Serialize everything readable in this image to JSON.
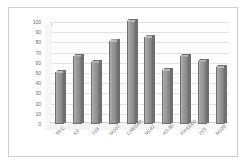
{
  "chart_data": {
    "type": "bar",
    "title": "",
    "subtitle": "",
    "xlabel": "",
    "ylabel": "",
    "categories": [
      "99-C",
      "K9",
      "2S9",
      "M107",
      "CAESAR",
      "M142",
      "AS-90",
      "PzH2000",
      "2S5",
      "M109"
    ],
    "values": [
      51,
      67,
      61,
      81,
      101,
      85,
      53,
      67,
      62,
      56
    ],
    "series": [
      {
        "name": "",
        "values": [
          51,
          67,
          61,
          81,
          101,
          85,
          53,
          67,
          62,
          56
        ]
      }
    ],
    "ylim": [
      0,
      100
    ],
    "ytick_labels": [
      "0",
      "10",
      "20",
      "30",
      "40",
      "50",
      "60",
      "70",
      "80",
      "90",
      "100"
    ],
    "ytick_values": [
      0,
      10,
      20,
      30,
      40,
      50,
      60,
      70,
      80,
      90,
      100
    ],
    "grid": true,
    "legend": false,
    "legend_position": "none",
    "style": "3d-column",
    "annotations": [],
    "colors": {
      "bar_face": "#9d9d9d",
      "bar_edge": "#6f6f6f",
      "bar_top": "#b9b9b9",
      "bar_side": "#6f6f6f",
      "gridline": "#e2e2e2",
      "axis": "#b8b8b8",
      "tick_text": "#6e6e6e",
      "label_text": "#777777",
      "frame_border": "#cfcfcf",
      "plot_background": "#fdfdfd",
      "floor": "#f2f2f2"
    }
  }
}
